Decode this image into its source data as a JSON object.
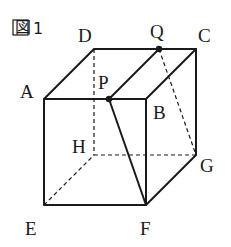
{
  "figure": {
    "caption": "図 1",
    "caption_prefix": "図",
    "caption_number": "1"
  },
  "vertices": {
    "A": {
      "label": "A",
      "x": 44,
      "y": 99
    },
    "B": {
      "label": "B",
      "x": 146,
      "y": 99
    },
    "C": {
      "label": "C",
      "x": 196,
      "y": 49
    },
    "D": {
      "label": "D",
      "x": 94,
      "y": 49
    },
    "E": {
      "label": "E",
      "x": 44,
      "y": 205
    },
    "F": {
      "label": "F",
      "x": 146,
      "y": 205
    },
    "G": {
      "label": "G",
      "x": 196,
      "y": 155
    },
    "H": {
      "label": "H",
      "x": 94,
      "y": 155
    }
  },
  "points": {
    "P": {
      "label": "P",
      "x": 109,
      "y": 99,
      "on_edge": "AB"
    },
    "Q": {
      "label": "Q",
      "x": 159,
      "y": 49,
      "on_edge": "DC"
    }
  },
  "edges": {
    "solid": [
      "AB",
      "BC",
      "CD",
      "DA",
      "AE",
      "EF",
      "BF",
      "CG",
      "FG",
      "PQ",
      "PF"
    ],
    "dashed": [
      "DH",
      "EH",
      "HG",
      "QG"
    ]
  },
  "colors": {
    "stroke": "#1a1a1a",
    "background": "#ffffff"
  }
}
